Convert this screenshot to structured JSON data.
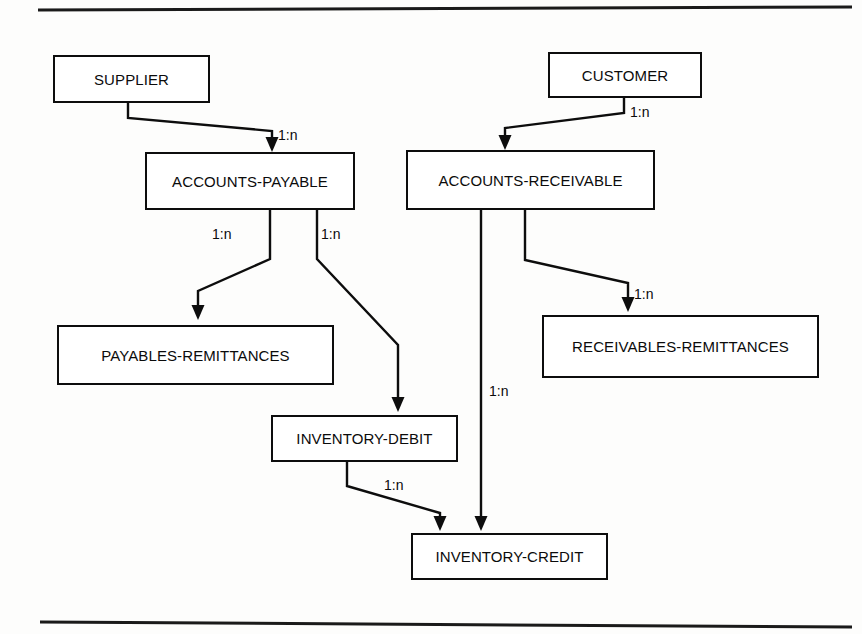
{
  "page": {
    "background_color": "#fdfdfc",
    "line_color": "#0d0d0d",
    "text_color": "#0b0b0b"
  },
  "rules": {
    "top_rule_name": "top-horizontal-rule",
    "bottom_rule_name": "bottom-horizontal-rule"
  },
  "entities": [
    {
      "id": "supplier",
      "label": "SUPPLIER",
      "x": 53,
      "y": 55,
      "w": 157,
      "h": 48
    },
    {
      "id": "customer",
      "label": "CUSTOMER",
      "x": 548,
      "y": 52,
      "w": 154,
      "h": 46
    },
    {
      "id": "accounts-payable",
      "label": "ACCOUNTS-PAYABLE",
      "x": 145,
      "y": 152,
      "w": 210,
      "h": 58
    },
    {
      "id": "accounts-receivable",
      "label": "ACCOUNTS-RECEIVABLE",
      "x": 406,
      "y": 150,
      "w": 249,
      "h": 60
    },
    {
      "id": "payables-remittances",
      "label": "PAYABLES-REMITTANCES",
      "x": 57,
      "y": 325,
      "w": 277,
      "h": 60
    },
    {
      "id": "receivables-remittances",
      "label": "RECEIVABLES-REMITTANCES",
      "x": 542,
      "y": 315,
      "w": 277,
      "h": 63
    },
    {
      "id": "inventory-debit",
      "label": "INVENTORY-DEBIT",
      "x": 271,
      "y": 415,
      "w": 187,
      "h": 47
    },
    {
      "id": "inventory-credit",
      "label": "INVENTORY-CREDIT",
      "x": 411,
      "y": 533,
      "w": 197,
      "h": 47
    }
  ],
  "relationships": [
    {
      "id": "supplier-to-accounts-payable",
      "from": "supplier",
      "to": "accounts-payable",
      "cardinality": "1:n",
      "label_x": 278,
      "label_y": 128,
      "path": "M 128,103 L 128,118 L 272,131 L 272,146",
      "arrow_x": 272,
      "arrow_y": 152,
      "arrow_dir": "down"
    },
    {
      "id": "customer-to-accounts-receivable",
      "from": "customer",
      "to": "accounts-receivable",
      "cardinality": "1:n",
      "label_x": 630,
      "label_y": 105,
      "path": "M 624,98 L 624,113 L 505,128 L 505,143",
      "arrow_x": 505,
      "arrow_y": 150,
      "arrow_dir": "down"
    },
    {
      "id": "accounts-payable-to-payables-remittances",
      "from": "accounts-payable",
      "to": "payables-remittances",
      "cardinality": "1:n",
      "label_x": 212,
      "label_y": 227,
      "path": "M 270,210 L 270,259 L 198,291 L 198,313",
      "arrow_x": 198,
      "arrow_y": 320,
      "arrow_dir": "down"
    },
    {
      "id": "accounts-payable-to-inventory-debit",
      "from": "accounts-payable",
      "to": "inventory-debit",
      "cardinality": "1:n",
      "label_x": 321,
      "label_y": 227,
      "path": "M 317,210 L 317,259 L 398,345 L 398,405",
      "arrow_x": 398,
      "arrow_y": 412,
      "arrow_dir": "down"
    },
    {
      "id": "accounts-receivable-to-receivables-remittances",
      "from": "accounts-receivable",
      "to": "receivables-remittances",
      "cardinality": "1:n",
      "label_x": 634,
      "label_y": 287,
      "path": "M 525,210 L 525,260 L 628,283 L 628,305",
      "arrow_x": 628,
      "arrow_y": 312,
      "arrow_dir": "down"
    },
    {
      "id": "accounts-receivable-to-inventory-credit",
      "from": "accounts-receivable",
      "to": "inventory-credit",
      "cardinality": "1:n",
      "label_x": 489,
      "label_y": 384,
      "path": "M 481,210 L 481,524",
      "arrow_x": 481,
      "arrow_y": 531,
      "arrow_dir": "down"
    },
    {
      "id": "inventory-debit-to-inventory-credit",
      "from": "inventory-debit",
      "to": "inventory-credit",
      "cardinality": "1:n",
      "label_x": 384,
      "label_y": 478,
      "path": "M 347,462 L 347,486 L 440,513 L 440,524",
      "arrow_x": 440,
      "arrow_y": 531,
      "arrow_dir": "down"
    }
  ]
}
